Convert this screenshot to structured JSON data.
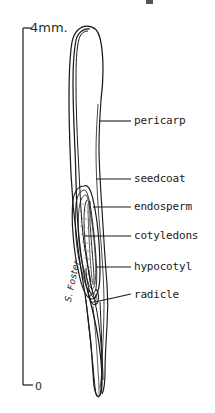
{
  "figure": {
    "background_color": "#ffffff",
    "ink_color": "#1a1a1a",
    "signature": "S. Foster"
  },
  "scale_bar": {
    "top_label": "4mm.",
    "bottom_label": "0",
    "axis_x": 23,
    "top_y": 28,
    "bottom_y": 385
  },
  "labels": [
    {
      "id": "pericarp",
      "text": "pericarp",
      "text_x": 134,
      "text_y": 117,
      "leader_x1": 100,
      "leader_y1": 121,
      "leader_x2": 131,
      "leader_y2": 121
    },
    {
      "id": "seedcoat",
      "text": "seedcoat",
      "text_x": 134,
      "text_y": 175,
      "leader_x1": 96,
      "leader_y1": 179,
      "leader_x2": 131,
      "leader_y2": 179
    },
    {
      "id": "endosperm",
      "text": "endosperm",
      "text_x": 134,
      "text_y": 203,
      "leader_x1": 93,
      "leader_y1": 207,
      "leader_x2": 131,
      "leader_y2": 207
    },
    {
      "id": "cotyledons",
      "text": "cotyledons",
      "text_x": 134,
      "text_y": 232,
      "leader_x1": 85,
      "leader_y1": 236,
      "leader_x2": 131,
      "leader_y2": 236
    },
    {
      "id": "hypocotyl",
      "text": "hypocotyl",
      "text_x": 134,
      "text_y": 263,
      "leader_x1": 96,
      "leader_y1": 267,
      "leader_x2": 131,
      "leader_y2": 267
    },
    {
      "id": "radicle",
      "text": "radicle",
      "text_x": 134,
      "text_y": 291,
      "leader_x1": 95,
      "leader_y1": 302,
      "leader_x2": 131,
      "leader_y2": 294
    }
  ],
  "structures": [
    {
      "id": "pericarp",
      "description": "outer fruit wall, double-line elongate outline"
    },
    {
      "id": "seedcoat",
      "description": "inner seed envelope surrounding embryo"
    },
    {
      "id": "endosperm",
      "description": "stippled nutritive tissue"
    },
    {
      "id": "cotyledons",
      "description": "paired embryonic leaves, elongate"
    },
    {
      "id": "hypocotyl",
      "description": "embryonic stem below cotyledons"
    },
    {
      "id": "radicle",
      "description": "embryonic root tip"
    }
  ]
}
